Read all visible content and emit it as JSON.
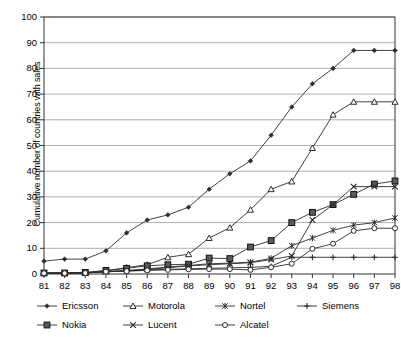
{
  "chart_data": {
    "type": "line",
    "title": "",
    "xlabel": "",
    "ylabel": "Cumulative number of countries with sales",
    "x": [
      "81",
      "82",
      "83",
      "84",
      "85",
      "86",
      "87",
      "88",
      "89",
      "90",
      "91",
      "92",
      "93",
      "94",
      "95",
      "96",
      "97",
      "98"
    ],
    "xlim": [
      0,
      17
    ],
    "ylim": [
      0,
      100
    ],
    "ytick_values": [
      0,
      10,
      20,
      30,
      40,
      50,
      60,
      70,
      80,
      90,
      100
    ],
    "xtick_labels": [
      "81",
      "82",
      "83",
      "84",
      "85",
      "86",
      "87",
      "88",
      "89",
      "90",
      "91",
      "92",
      "93",
      "94",
      "95",
      "96",
      "97",
      "98"
    ],
    "grid": "horizontal",
    "legend_position": "bottom",
    "series": [
      {
        "name": "Ericsson",
        "marker": "diamond",
        "color": "#2b2b2b",
        "values": [
          5,
          5.8,
          5.8,
          9,
          16,
          21,
          23,
          26,
          33,
          39,
          44,
          54,
          65,
          74,
          80,
          87,
          87,
          87
        ]
      },
      {
        "name": "Motorola",
        "marker": "triangle",
        "color": "#2b2b2b",
        "values": [
          0.4,
          0.4,
          0.5,
          1.2,
          2.5,
          3.6,
          6.5,
          7.7,
          14,
          18,
          25,
          33,
          36,
          49,
          62,
          67,
          67,
          67
        ]
      },
      {
        "name": "Nortel",
        "marker": "asterisk",
        "color": "#2b2b2b",
        "values": [
          0.3,
          0.3,
          0.4,
          0.8,
          1.3,
          2.0,
          2.7,
          3.3,
          4.0,
          4.2,
          4.6,
          6.1,
          11,
          14,
          17,
          19,
          20,
          21.8
        ]
      },
      {
        "name": "Siemens",
        "marker": "plus",
        "color": "#2b2b2b",
        "values": [
          0.3,
          0.3,
          0.4,
          1.0,
          1.2,
          1.6,
          1.8,
          2.0,
          2.2,
          2.4,
          2.6,
          3.0,
          6.5,
          6.5,
          6.5,
          6.5,
          6.5,
          6.5
        ]
      },
      {
        "name": "Nokia",
        "marker": "square",
        "color": "#2b2b2b",
        "values": [
          0.4,
          0.4,
          0.6,
          1.4,
          2.2,
          3.2,
          3.6,
          3.8,
          6.2,
          6.0,
          10.5,
          13,
          20,
          24,
          27,
          31,
          35,
          36.2
        ]
      },
      {
        "name": "Lucent",
        "marker": "cross",
        "color": "#2b2b2b",
        "values": [
          0.3,
          0.3,
          0.4,
          1.0,
          1.3,
          1.8,
          2.4,
          3.2,
          3.6,
          4.0,
          4.4,
          5.6,
          7.0,
          21,
          27,
          34,
          34,
          34
        ]
      },
      {
        "name": "Alcatel",
        "marker": "circle",
        "color": "#2b2b2b",
        "values": [
          0.3,
          0.3,
          0.4,
          0.9,
          1.1,
          1.4,
          1.6,
          1.8,
          1.9,
          1.9,
          1.6,
          2.6,
          4.0,
          9.8,
          11.8,
          16.8,
          17.8,
          17.8
        ]
      }
    ]
  },
  "legend": {
    "rows": [
      [
        "Ericsson",
        "Motorola",
        "Nortel",
        "Siemens"
      ],
      [
        "Nokia",
        "Lucent",
        "Alcatel"
      ]
    ]
  }
}
